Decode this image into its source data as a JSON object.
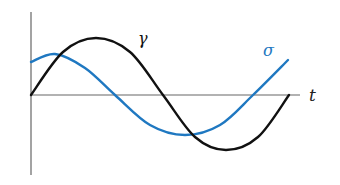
{
  "figure": {
    "labels": {
      "gamma": "γ",
      "sigma": "σ",
      "t_axis": "t"
    },
    "colors": {
      "gamma": "#111111",
      "sigma": "#1f78c1",
      "axis": "#666666",
      "background": "#ffffff"
    }
  },
  "chart_data": {
    "type": "line",
    "title": "",
    "xlabel": "t",
    "ylabel": "",
    "grid": false,
    "legend": "inline labels",
    "series": [
      {
        "name": "γ",
        "description": "sine wave starting at origin, one full period",
        "points_px": [
          [
            31,
            95
          ],
          [
            63,
            52
          ],
          [
            96,
            38
          ],
          [
            130,
            52
          ],
          [
            163,
            95
          ],
          [
            195,
            137
          ],
          [
            226,
            150
          ],
          [
            258,
            137
          ],
          [
            289,
            95
          ]
        ]
      },
      {
        "name": "σ",
        "description": "phase-shifted sinusoid, starts positive, peaks early",
        "points_px": [
          [
            31,
            62
          ],
          [
            55,
            54
          ],
          [
            85,
            68
          ],
          [
            115,
            95
          ],
          [
            150,
            125
          ],
          [
            185,
            135
          ],
          [
            220,
            125
          ],
          [
            253,
            95
          ],
          [
            288,
            60
          ]
        ]
      }
    ],
    "axes": {
      "origin_px": [
        31,
        95
      ],
      "x_axis_end_px": 300,
      "y_axis_top_px": 12,
      "y_axis_bottom_px": 175
    }
  }
}
